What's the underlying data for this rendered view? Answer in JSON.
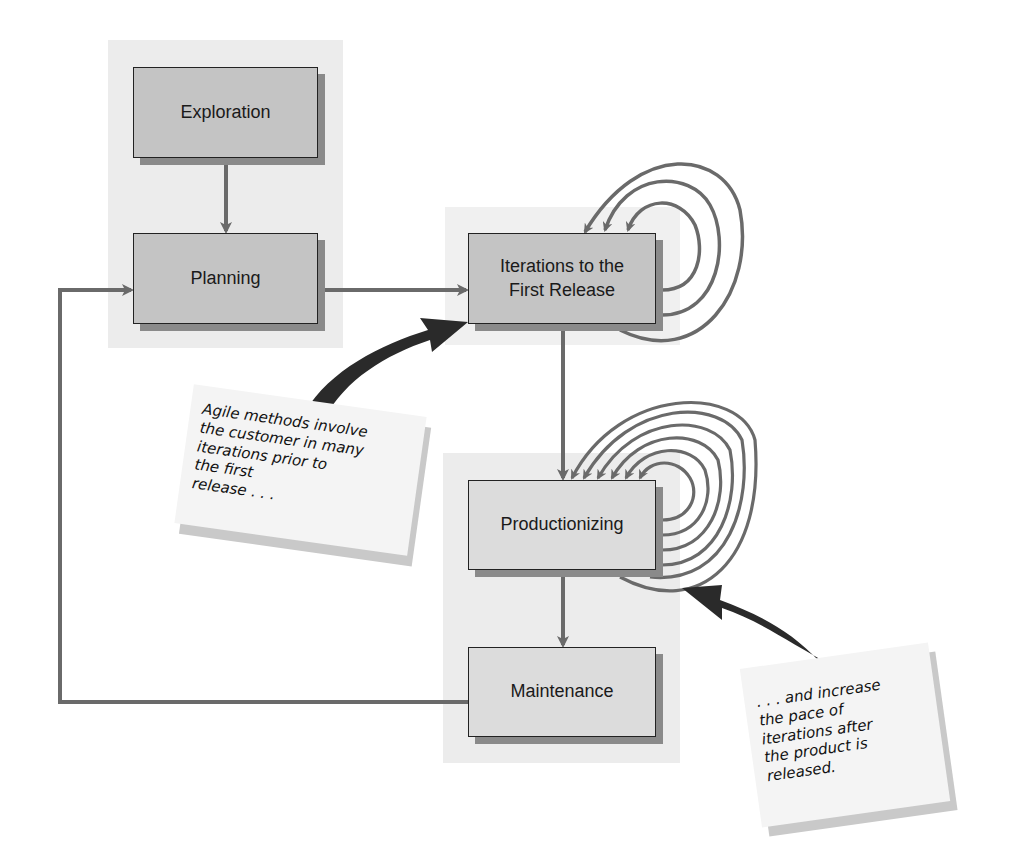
{
  "diagram": {
    "nodes": {
      "exploration": "Exploration",
      "planning": "Planning",
      "iterations": "Iterations to the First Release",
      "iterations_line1": "Iterations to the",
      "iterations_line2": "First Release",
      "productionizing": "Productionizing",
      "maintenance": "Maintenance"
    },
    "edges": [
      {
        "from": "Exploration",
        "to": "Planning"
      },
      {
        "from": "Planning",
        "to": "Iterations to the First Release"
      },
      {
        "from": "Iterations to the First Release",
        "to": "Iterations to the First Release",
        "type": "self-loop",
        "count": 3
      },
      {
        "from": "Iterations to the First Release",
        "to": "Productionizing"
      },
      {
        "from": "Productionizing",
        "to": "Productionizing",
        "type": "self-loop",
        "count": 6
      },
      {
        "from": "Productionizing",
        "to": "Maintenance"
      },
      {
        "from": "Maintenance",
        "to": "Planning",
        "type": "feedback"
      }
    ],
    "notes": {
      "first": "Agile methods involve the customer in many iterations prior to the first release . . .",
      "first_lines": [
        "Agile methods involve",
        "the customer in many",
        "iterations prior to",
        "the first",
        "release . . ."
      ],
      "second": ". . . and increase the pace of iterations after the product is released.",
      "second_lines": [
        ". . . and increase",
        "the pace of",
        "iterations after",
        "the product is",
        "released."
      ]
    },
    "colors": {
      "box_fill": "#c4c4c4",
      "box_fill_light": "#dcdcdc",
      "connector": "#6a6a6a",
      "callout_arrow": "#2a2a2a",
      "panel": "#ececec"
    }
  }
}
